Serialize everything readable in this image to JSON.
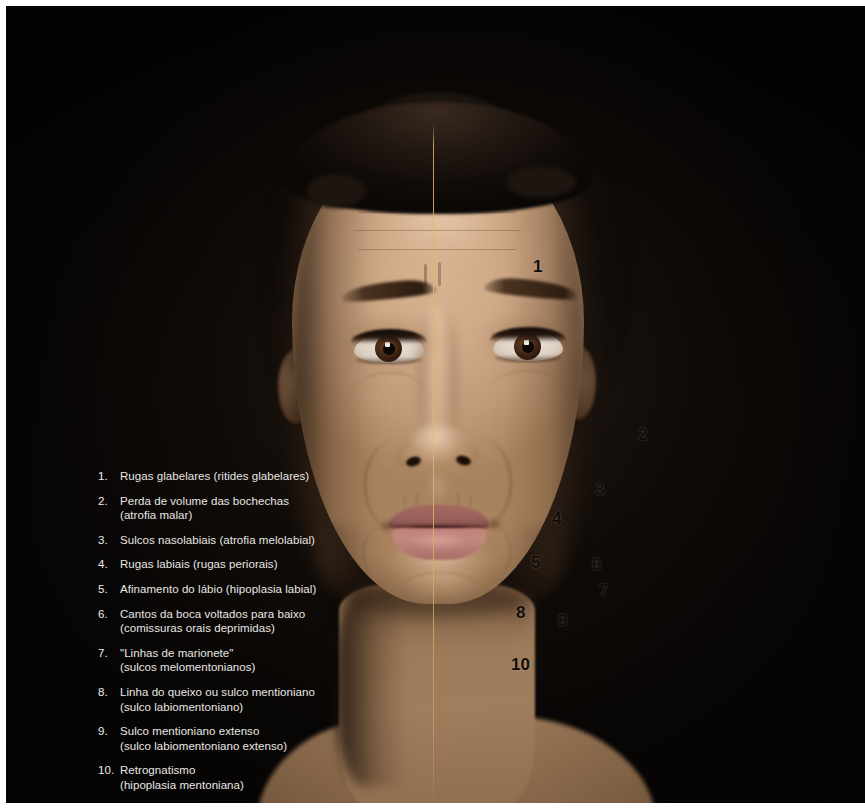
{
  "figure": {
    "language": "pt-BR",
    "background_color": "#050403",
    "legend_text_color": "#e9e7e4",
    "callout_text_color": "#100c08",
    "midline_color": "#dcb06e"
  },
  "legend": {
    "items": [
      {
        "number": "1.",
        "primary": "Rugas glabelares (ritides glabelares)",
        "secondary": ""
      },
      {
        "number": "2.",
        "primary": "Perda de volume das bochechas",
        "secondary": "(atrofia malar)"
      },
      {
        "number": "3.",
        "primary": "Sulcos nasolabiais (atrofia melolabial)",
        "secondary": ""
      },
      {
        "number": "4.",
        "primary": "Rugas labiais (rugas periorais)",
        "secondary": ""
      },
      {
        "number": "5.",
        "primary": "Afinamento do lábio (hipoplasia labial)",
        "secondary": ""
      },
      {
        "number": "6.",
        "primary": "Cantos da boca voltados para baixo",
        "secondary": "(comissuras orais deprimidas)"
      },
      {
        "number": "7.",
        "primary": "\"Linhas de marionete\"",
        "secondary": "(sulcos melomentonianos)"
      },
      {
        "number": "8.",
        "primary": "Linha do queixo ou sulco mentioniano",
        "secondary": "(sulco labiomentoniano)"
      },
      {
        "number": "9.",
        "primary": "Sulco mentioniano extenso",
        "secondary": "(sulco labiomentoniano extenso)"
      },
      {
        "number": "10.",
        "primary": "Retrognatismo",
        "secondary": "(hipoplasia mentoniana)"
      }
    ]
  },
  "callouts": [
    {
      "label": "1",
      "x": 533,
      "y": 260,
      "anatomy": "glabellar-lines"
    },
    {
      "label": "2",
      "x": 638,
      "y": 428,
      "anatomy": "malar-volume-loss"
    },
    {
      "label": "3",
      "x": 595,
      "y": 483,
      "anatomy": "nasolabial-fold"
    },
    {
      "label": "4",
      "x": 552,
      "y": 512,
      "anatomy": "perioral-lines"
    },
    {
      "label": "5",
      "x": 531,
      "y": 556,
      "anatomy": "lip-thinning"
    },
    {
      "label": "6",
      "x": 592,
      "y": 558,
      "anatomy": "oral-commissure"
    },
    {
      "label": "7",
      "x": 599,
      "y": 584,
      "anatomy": "marionette-lines"
    },
    {
      "label": "8",
      "x": 516,
      "y": 606,
      "anatomy": "mentolabial-sulcus"
    },
    {
      "label": "9",
      "x": 558,
      "y": 614,
      "anatomy": "extended-mentolabial-sulcus"
    },
    {
      "label": "10",
      "x": 511,
      "y": 658,
      "anatomy": "retrognathia"
    }
  ]
}
